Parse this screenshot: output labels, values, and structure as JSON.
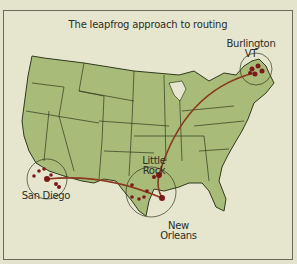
{
  "title": "The leapfrog approach to routing",
  "colors": {
    "background": "#e6e6cf",
    "land": "#a9bb78",
    "border": "#2f3a1c",
    "route": "#8a3a1e",
    "dot": "#7a1a1a"
  },
  "cities": [
    {
      "name": "Burlington VT",
      "line1": "Burlington",
      "line2": "VT"
    },
    {
      "name": "Little Rock",
      "line1": "Little",
      "line2": "Rock"
    },
    {
      "name": "San Diego",
      "line1": "San Diego",
      "line2": ""
    },
    {
      "name": "New Orleans",
      "line1": "New",
      "line2": "Orleans"
    }
  ],
  "routes": [
    {
      "from": "San Diego",
      "to": "New Orleans"
    },
    {
      "from": "New Orleans",
      "to": "Little Rock"
    },
    {
      "from": "Little Rock",
      "to": "Burlington VT"
    }
  ]
}
